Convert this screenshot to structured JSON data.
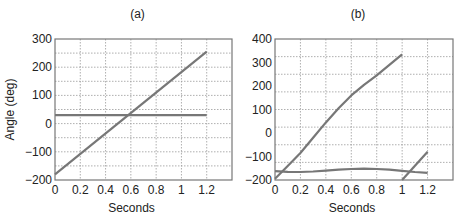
{
  "chart_data": [
    {
      "type": "line",
      "title": "(a)",
      "xlabel": "Seconds",
      "ylabel": "Angle (deg)",
      "xlim": [
        0,
        1.4
      ],
      "ylim": [
        -200,
        300
      ],
      "xticks": [
        0,
        0.2,
        0.4,
        0.6,
        0.8,
        1,
        1.2
      ],
      "xtick_labels": [
        "0",
        "0.2",
        "0.4",
        "0.6",
        "0.8",
        "1",
        "1.2"
      ],
      "yticks": [
        -200,
        -100,
        0,
        100,
        200,
        300
      ],
      "ytick_labels": [
        "−200",
        "−100",
        "0",
        "100",
        "200",
        "300"
      ],
      "grid": true,
      "grid_y_step": 50,
      "series": [
        {
          "name": "ramp",
          "x": [
            0,
            1.2
          ],
          "y": [
            -180,
            255
          ]
        },
        {
          "name": "constant",
          "x": [
            0,
            1.2
          ],
          "y": [
            30,
            30
          ]
        }
      ]
    },
    {
      "type": "line",
      "title": "(b)",
      "xlabel": "Seconds",
      "ylabel": "",
      "xlim": [
        0,
        1.4
      ],
      "ylim": [
        -200,
        400
      ],
      "xticks": [
        0,
        0.2,
        0.4,
        0.6,
        0.8,
        1,
        1.2
      ],
      "xtick_labels": [
        "0",
        "0.2",
        "0.4",
        "0.6",
        "0.8",
        "1",
        "1.2"
      ],
      "yticks": [
        -200,
        -100,
        0,
        100,
        200,
        300,
        400
      ],
      "ytick_labels": [
        "−200",
        "−100",
        "0",
        "100",
        "200",
        "300",
        "400"
      ],
      "grid": true,
      "grid_y_step": 75,
      "series": [
        {
          "name": "rising",
          "x": [
            0,
            0.1,
            0.2,
            0.3,
            0.4,
            0.5,
            0.6,
            0.7,
            0.8,
            0.9,
            1.0
          ],
          "y": [
            -195,
            -140,
            -85,
            -20,
            45,
            105,
            160,
            205,
            245,
            290,
            335
          ]
        },
        {
          "name": "wave",
          "x": [
            0,
            0.1,
            0.2,
            0.3,
            0.4,
            0.5,
            0.6,
            0.7,
            0.8,
            0.9,
            1.0,
            1.1,
            1.2
          ],
          "y": [
            -162,
            -165,
            -166,
            -164,
            -160,
            -156,
            -153,
            -152,
            -153,
            -156,
            -161,
            -166,
            -170
          ]
        },
        {
          "name": "wrap",
          "x": [
            1.0,
            1.2
          ],
          "y": [
            -200,
            -80
          ]
        }
      ]
    }
  ]
}
